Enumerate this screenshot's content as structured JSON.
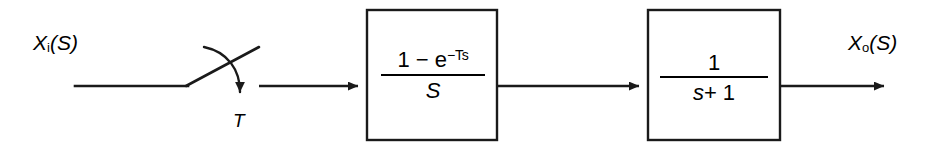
{
  "diagram": {
    "type": "block-diagram",
    "background_color": "#ffffff",
    "stroke_color": "#1a1a1a",
    "canvas": {
      "width": 941,
      "height": 150
    },
    "signal_line_y": 86
  },
  "labels": {
    "input": {
      "base": "X",
      "subscript": "i",
      "arg": "(S)",
      "text": "Xi(S)"
    },
    "output": {
      "base": "X",
      "subscript": "o",
      "arg": "(S)",
      "text": "Xo(S)"
    },
    "sampling_period": {
      "text": "T"
    }
  },
  "sampler": {
    "name": "sampler-switch",
    "period_label": "T",
    "contact_start_x": 75,
    "pivot_x": 187,
    "blade_tip_x": 258,
    "blade_tip_y": 48,
    "arrow_tip_x": 240,
    "arrow_tip_y": 102
  },
  "blocks": [
    {
      "id": "zero-order-hold",
      "name": "zero-order-hold-block",
      "x": 367,
      "y": 10,
      "width": 130,
      "height": 130,
      "expression": {
        "numerator_prefix": "1 − e",
        "numerator_exponent": "−Ts",
        "denominator": "S",
        "text": "(1 - e^-Ts) / S"
      }
    },
    {
      "id": "first-order-plant",
      "name": "first-order-plant-block",
      "x": 648,
      "y": 10,
      "width": 132,
      "height": 130,
      "expression": {
        "numerator": "1",
        "denominator_var": "s",
        "denominator_rest": "+ 1",
        "text": "1 / (s + 1)"
      }
    }
  ],
  "connectors": [
    {
      "name": "input-to-sampler",
      "from_x": 75,
      "to_x": 187,
      "y": 86,
      "arrow": false
    },
    {
      "name": "sampler-to-hold",
      "from_x": 258,
      "to_x": 367,
      "y": 86,
      "arrow": true
    },
    {
      "name": "hold-to-plant",
      "from_x": 497,
      "to_x": 648,
      "y": 86,
      "arrow": true
    },
    {
      "name": "plant-to-output",
      "from_x": 780,
      "to_x": 893,
      "y": 86,
      "arrow": true
    }
  ]
}
